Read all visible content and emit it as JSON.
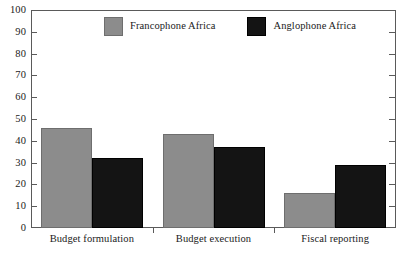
{
  "chart_data": {
    "type": "bar",
    "title": "",
    "subtitle": "",
    "xlabel": "",
    "ylabel": "",
    "categories": [
      "Budget formulation",
      "Budget execution",
      "Fiscal reporting"
    ],
    "series": [
      {
        "name": "Francophone Africa",
        "color": "#8c8c8c",
        "values": [
          46,
          43,
          16
        ]
      },
      {
        "name": "Anglophone Africa",
        "color": "#141414",
        "values": [
          32,
          37,
          29
        ]
      }
    ],
    "ylim": [
      0,
      100
    ],
    "ytick_step": 10,
    "yticks": [
      0,
      10,
      20,
      30,
      40,
      50,
      60,
      70,
      80,
      90,
      100
    ],
    "ytick_labels": [
      "0",
      "10",
      "20",
      "30",
      "40",
      "50",
      "60",
      "70",
      "80",
      "90",
      "100"
    ],
    "grid": false,
    "legend_position": "top-center",
    "right_axis_ticks": true,
    "right_axis_labels": false,
    "frame": true
  }
}
